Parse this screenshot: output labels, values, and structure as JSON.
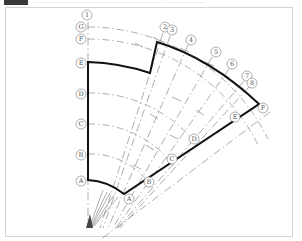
{
  "header": {
    "text": "…………………………………………  ……………"
  },
  "diagram": {
    "type": "fan-shaped structural grid plan",
    "radial_axes": [
      "1",
      "2",
      "3",
      "4",
      "5",
      "6",
      "7",
      "8"
    ],
    "arc_axes_left": [
      "G",
      "F",
      "E",
      "D",
      "C",
      "B",
      "A"
    ],
    "arc_axes_right": [
      "F",
      "E",
      "D",
      "C",
      "B",
      "A"
    ],
    "colors": {
      "outline": "#111111",
      "axis_line": "#888888",
      "bubble": "#777777",
      "frame": "#d4d4d4"
    }
  },
  "labels": {
    "ax1": "1",
    "ax2": "2",
    "ax3": "3",
    "ax4": "4",
    "ax5": "5",
    "ax6": "6",
    "ax7": "7",
    "ax8": "8",
    "lG": "G",
    "lF": "F",
    "lE": "E",
    "lD": "D",
    "lC": "C",
    "lB": "B",
    "lA": "A",
    "rF": "F",
    "rE": "E",
    "rD": "D",
    "rC": "C",
    "rB": "B",
    "rA": "A"
  }
}
